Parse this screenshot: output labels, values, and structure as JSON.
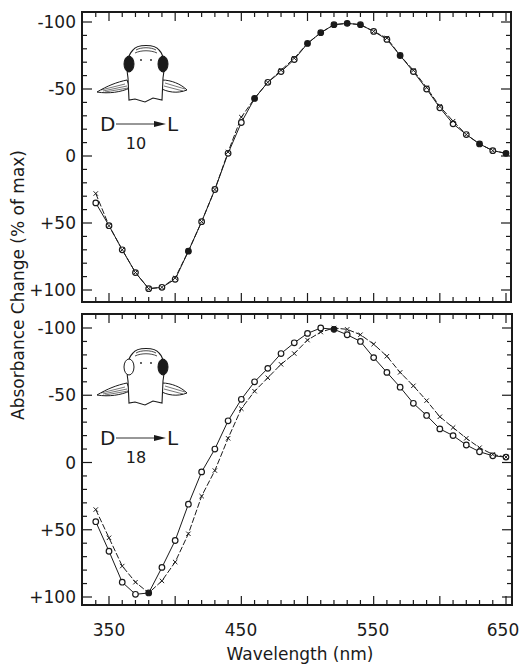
{
  "chart_data": [
    {
      "type": "line",
      "panel": "top",
      "xlabel": "Wavelength (nm)",
      "ylabel": "Absorbance Change (% of max)",
      "xlim": [
        340,
        650
      ],
      "ylim": [
        -100,
        100
      ],
      "y_inverted": true,
      "x_ticks": [
        350,
        450,
        550,
        650
      ],
      "y_ticks": [
        -100,
        -50,
        0,
        50,
        100
      ],
      "y_tick_labels": [
        "-100",
        "-50",
        "0",
        "+50",
        "+100"
      ],
      "annotation": {
        "from": "D",
        "to": "L",
        "value": "10"
      },
      "fish_icon": "both-eyes-dark",
      "x": [
        340,
        350,
        360,
        370,
        380,
        390,
        400,
        410,
        420,
        430,
        440,
        450,
        460,
        470,
        480,
        490,
        500,
        510,
        520,
        530,
        540,
        550,
        560,
        570,
        580,
        590,
        600,
        610,
        620,
        630,
        640,
        650
      ],
      "series": [
        {
          "name": "circles",
          "marker": "open-circle",
          "values": [
            35,
            52,
            70,
            87,
            99,
            98,
            92,
            71,
            49,
            25,
            -2,
            -25,
            -43,
            -55,
            -63,
            -72,
            -84,
            -92,
            -98,
            -99,
            -98,
            -93,
            -87,
            -75,
            -63,
            -50,
            -36,
            -24,
            -16,
            -9,
            -4,
            -2
          ]
        },
        {
          "name": "crosses",
          "marker": "x",
          "values": [
            28,
            52,
            70,
            87,
            99,
            98,
            91,
            71,
            49,
            25,
            -3,
            -29,
            -43,
            -55,
            -64,
            -73,
            -84,
            -92,
            -98,
            -99,
            -98,
            -93,
            -88,
            -75,
            -64,
            -51,
            -37,
            -26,
            -16,
            -9,
            -4,
            -2
          ]
        }
      ],
      "filled_points_x": [
        410,
        460,
        500,
        510,
        520,
        530,
        540,
        570,
        630,
        650
      ]
    },
    {
      "type": "line",
      "panel": "bottom",
      "xlabel": "Wavelength (nm)",
      "ylabel": "Absorbance Change (% of max)",
      "xlim": [
        340,
        650
      ],
      "ylim": [
        -100,
        100
      ],
      "y_inverted": true,
      "x_ticks": [
        350,
        450,
        550,
        650
      ],
      "y_ticks": [
        -100,
        -50,
        0,
        50,
        100
      ],
      "y_tick_labels": [
        "-100",
        "-50",
        "0",
        "+50",
        "+100"
      ],
      "annotation": {
        "from": "D",
        "to": "L",
        "value": "18"
      },
      "fish_icon": "one-eye-dark",
      "x": [
        340,
        350,
        360,
        370,
        380,
        390,
        400,
        410,
        420,
        430,
        440,
        450,
        460,
        470,
        480,
        490,
        500,
        510,
        520,
        530,
        540,
        550,
        560,
        570,
        580,
        590,
        600,
        610,
        620,
        630,
        640,
        650
      ],
      "series": [
        {
          "name": "circles",
          "marker": "open-circle",
          "values": [
            44,
            66,
            89,
            98,
            97,
            78,
            58,
            31,
            7,
            -10,
            -31,
            -47,
            -60,
            -70,
            -81,
            -89,
            -96,
            -100,
            -99,
            -95,
            -90,
            -78,
            -67,
            -56,
            -44,
            -35,
            -25,
            -20,
            -13,
            -8,
            -5,
            -4
          ]
        },
        {
          "name": "crosses",
          "marker": "x",
          "values": [
            35,
            56,
            77,
            89,
            97,
            88,
            74,
            53,
            25,
            6,
            -18,
            -40,
            -53,
            -63,
            -73,
            -81,
            -91,
            -97,
            -100,
            -99,
            -95,
            -88,
            -79,
            -67,
            -57,
            -46,
            -34,
            -26,
            -18,
            -11,
            -6,
            -4
          ]
        }
      ],
      "filled_points_x": [
        380,
        520
      ]
    }
  ],
  "labels": {
    "ylabel": "Absorbance Change (% of max)",
    "xlabel": "Wavelength (nm)",
    "x_tick_labels": [
      "350",
      "450",
      "550",
      "650"
    ]
  }
}
